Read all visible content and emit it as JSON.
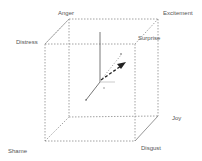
{
  "diagram": {
    "type": "emotion-cube",
    "labels": {
      "anger": "Anger",
      "excitement": "Excitement",
      "distress": "Distress",
      "surprise": "Surprise",
      "joy": "Joy",
      "shame": "Shame",
      "disgust": "Disgust"
    },
    "colors": {
      "edge": "#8a8a8a",
      "axis": "#555555",
      "arrow": "#222222",
      "text": "#555555"
    }
  }
}
